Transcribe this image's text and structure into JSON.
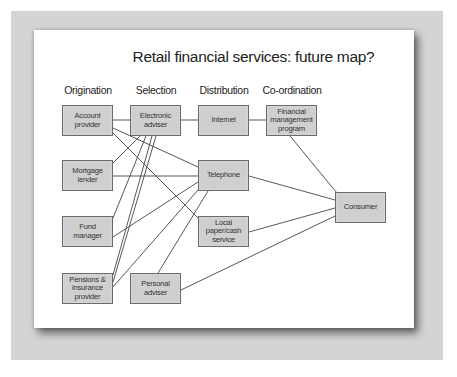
{
  "diagram": {
    "title": "Retail financial services: future map?",
    "columns": [
      {
        "id": "origination",
        "label": "Origination",
        "x": 88
      },
      {
        "id": "selection",
        "label": "Selection",
        "x": 156
      },
      {
        "id": "distribution",
        "label": "Distribution",
        "x": 224
      },
      {
        "id": "coordination",
        "label": "Co-ordination",
        "x": 292
      }
    ],
    "nodes": [
      {
        "id": "account-provider",
        "label": "Account\nprovider",
        "x": 62,
        "y": 105
      },
      {
        "id": "mortgage-lender",
        "label": "Mortgage\nlender",
        "x": 62,
        "y": 160
      },
      {
        "id": "fund-manager",
        "label": "Fund\nmanager",
        "x": 62,
        "y": 216
      },
      {
        "id": "pensions-insurance-provider",
        "label": "Pensions &\ninsurance\nprovider",
        "x": 62,
        "y": 273
      },
      {
        "id": "electronic-adviser",
        "label": "Electronic\nadviser",
        "x": 130,
        "y": 105
      },
      {
        "id": "personal-adviser",
        "label": "Personal\nadviser",
        "x": 130,
        "y": 273
      },
      {
        "id": "internet",
        "label": "Internet",
        "x": 198,
        "y": 105
      },
      {
        "id": "telephone",
        "label": "Telephone",
        "x": 198,
        "y": 160
      },
      {
        "id": "local-paper-cash-service",
        "label": "Local\npaper/cash\nservice",
        "x": 198,
        "y": 216
      },
      {
        "id": "financial-management-program",
        "label": "Financial\nmanagement\nprogram",
        "x": 266,
        "y": 105
      },
      {
        "id": "consumer",
        "label": "Consumer",
        "x": 335,
        "y": 192
      }
    ],
    "edges": [
      {
        "from": "account-provider",
        "to": "electronic-adviser",
        "x1": 113,
        "y1": 120,
        "x2": 130,
        "y2": 120
      },
      {
        "from": "electronic-adviser",
        "to": "internet",
        "x1": 181,
        "y1": 120,
        "x2": 198,
        "y2": 120
      },
      {
        "from": "internet",
        "to": "financial-management-program",
        "x1": 249,
        "y1": 120,
        "x2": 266,
        "y2": 120
      },
      {
        "from": "account-provider",
        "to": "telephone",
        "x1": 113,
        "y1": 128,
        "x2": 198,
        "y2": 167
      },
      {
        "from": "account-provider",
        "to": "local-paper-cash-service",
        "x1": 113,
        "y1": 133,
        "x2": 198,
        "y2": 218
      },
      {
        "from": "electronic-adviser",
        "to": "mortgage-lender",
        "x1": 140,
        "y1": 136,
        "x2": 113,
        "y2": 163
      },
      {
        "from": "electronic-adviser",
        "to": "fund-manager",
        "x1": 146,
        "y1": 136,
        "x2": 113,
        "y2": 218
      },
      {
        "from": "electronic-adviser",
        "to": "pensions-insurance-provider",
        "x1": 152,
        "y1": 136,
        "x2": 113,
        "y2": 275
      },
      {
        "from": "electronic-adviser",
        "to": "pensions-insurance-provider",
        "x1": 156,
        "y1": 136,
        "x2": 113,
        "y2": 282
      },
      {
        "from": "mortgage-lender",
        "to": "telephone",
        "x1": 113,
        "y1": 176,
        "x2": 198,
        "y2": 176
      },
      {
        "from": "fund-manager",
        "to": "telephone",
        "x1": 113,
        "y1": 237,
        "x2": 198,
        "y2": 182
      },
      {
        "from": "pensions-insurance-provider",
        "to": "telephone",
        "x1": 113,
        "y1": 287,
        "x2": 198,
        "y2": 190
      },
      {
        "from": "personal-adviser",
        "to": "telephone",
        "x1": 158,
        "y1": 273,
        "x2": 208,
        "y2": 191
      },
      {
        "from": "telephone",
        "to": "consumer",
        "x1": 249,
        "y1": 176,
        "x2": 335,
        "y2": 200
      },
      {
        "from": "local-paper-cash-service",
        "to": "consumer",
        "x1": 249,
        "y1": 232,
        "x2": 335,
        "y2": 208
      },
      {
        "from": "personal-adviser",
        "to": "consumer",
        "x1": 181,
        "y1": 290,
        "x2": 335,
        "y2": 216
      },
      {
        "from": "financial-management-program",
        "to": "consumer",
        "x1": 290,
        "y1": 136,
        "x2": 337,
        "y2": 193
      }
    ],
    "colors": {
      "node_fill": "#cfcfcf",
      "node_border": "#6a6a6a",
      "line": "#444444",
      "backdrop": "#d4d4d4",
      "slide": "#ffffff"
    }
  }
}
